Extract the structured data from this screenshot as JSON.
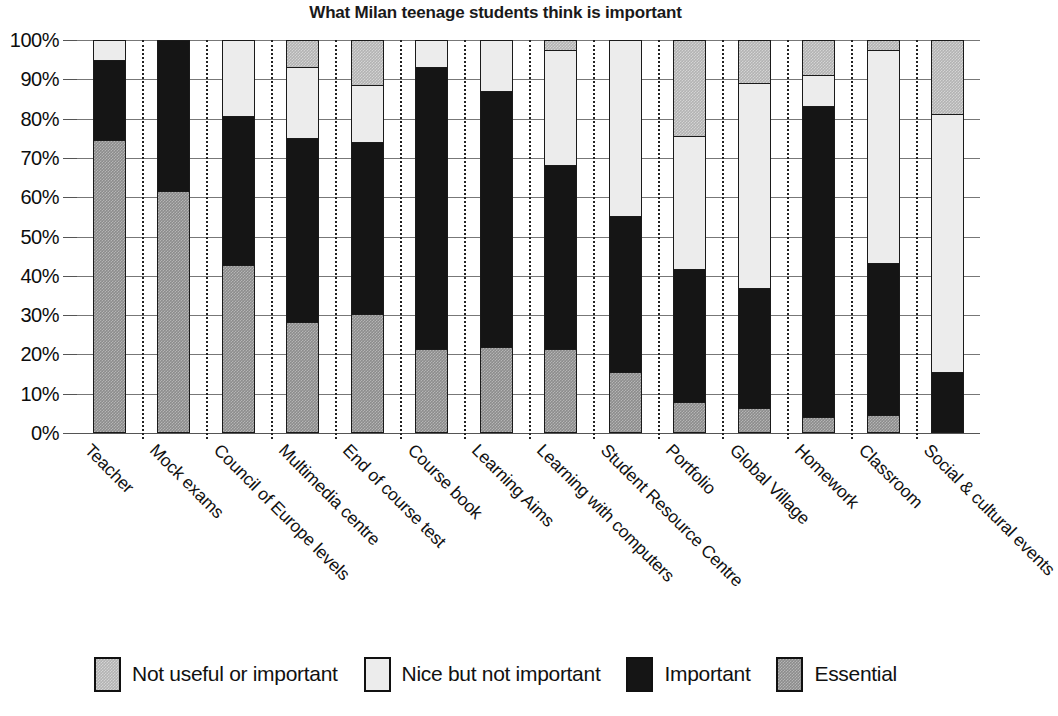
{
  "chart_data": {
    "type": "bar",
    "subtype": "stacked-percentage",
    "title": "What Milan teenage students think is important",
    "xlabel": "",
    "ylabel": "",
    "ylim": [
      0,
      100
    ],
    "grid": true,
    "legend_position": "bottom",
    "y_ticks": [
      "0%",
      "10%",
      "20%",
      "30%",
      "40%",
      "50%",
      "60%",
      "70%",
      "80%",
      "90%",
      "100%"
    ],
    "y_tick_values": [
      0,
      10,
      20,
      30,
      40,
      50,
      60,
      70,
      80,
      90,
      100
    ],
    "categories": [
      "Teacher",
      "Mock exams",
      "Council of Europe levels",
      "Multimedia centre",
      "End of course test",
      "Course book",
      "Learning Aims",
      "Learning with computers",
      "Student Resource Centre",
      "Portfolio",
      "Global Village",
      "Homework",
      "Classroom",
      "Social & cultural events"
    ],
    "series": [
      {
        "name": "Essential",
        "color": "#8c8c8c",
        "values": [
          74.5,
          61.5,
          42.5,
          28,
          30,
          21,
          21.5,
          21,
          15,
          7.5,
          6,
          3.5,
          4,
          0
        ]
      },
      {
        "name": "Important",
        "color": "#151515",
        "values": [
          20.5,
          38.5,
          38,
          47,
          44,
          72,
          65.5,
          47,
          40,
          34,
          30.5,
          79.5,
          39,
          15
        ]
      },
      {
        "name": "Nice but not important",
        "color": "#ececec",
        "values": [
          5,
          0,
          19.5,
          18,
          14.5,
          7,
          13,
          29.5,
          45,
          34,
          52.5,
          8,
          54.5,
          66
        ]
      },
      {
        "name": "Not useful or important",
        "color": "#b3b3b3",
        "values": [
          0,
          0,
          0,
          7,
          11.5,
          0,
          0,
          2.5,
          0,
          24.5,
          11,
          9,
          2.5,
          19
        ]
      }
    ],
    "stack_order_bottom_to_top": [
      "Essential",
      "Important",
      "Nice but not important",
      "Not useful or important"
    ]
  },
  "legend": {
    "items": [
      {
        "label": "Not useful or important",
        "swatch": "notuseful"
      },
      {
        "label": "Nice but not important",
        "swatch": "nice"
      },
      {
        "label": "Important",
        "swatch": "important"
      },
      {
        "label": "Essential",
        "swatch": "essential"
      }
    ]
  }
}
